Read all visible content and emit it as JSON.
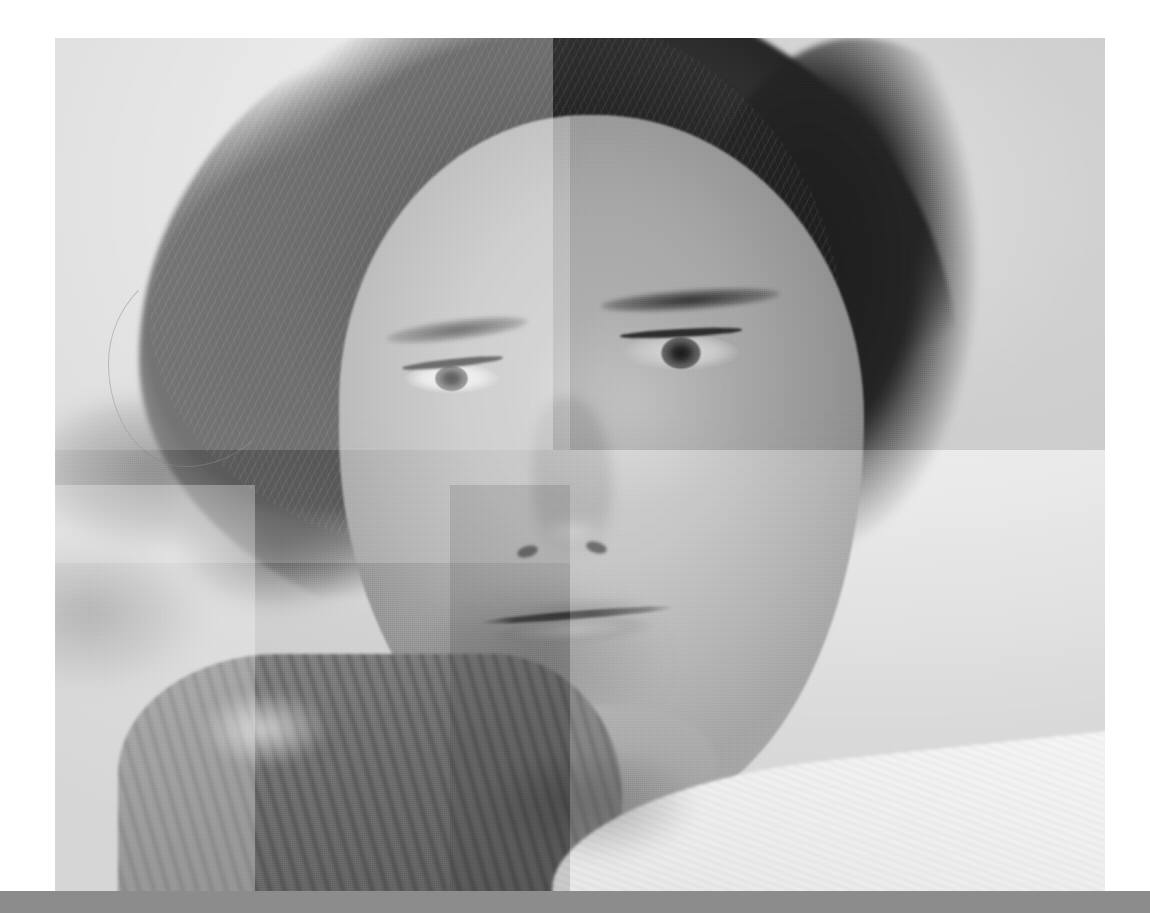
{
  "page": {
    "background_color": "#ffffff",
    "width": 1150,
    "height": 913
  },
  "photo": {
    "name": "grayscale-portrait",
    "subject": "woman looking at camera, curly dark hair, light knit sweater, dark jacket collar",
    "treatment": "black and white",
    "frame": {
      "left": 55,
      "top": 38,
      "width": 1050,
      "height": 855
    },
    "alt_text": "Black and white portrait of a woman with dark curly hair"
  },
  "overlay": {
    "description": "translucent rectangular panels forming an offset grid",
    "lighten_color": "#ffffff",
    "darken_color": "#282828",
    "panels": [
      {
        "name": "overlay-panel-top-left",
        "left": 0,
        "top": 0,
        "width": 498,
        "height": 412,
        "tone": "lighten"
      },
      {
        "name": "overlay-panel-top-right",
        "left": 515,
        "top": 0,
        "width": 535,
        "height": 412,
        "tone": "darken"
      },
      {
        "name": "overlay-panel-mid-band",
        "left": 0,
        "top": 412,
        "width": 1050,
        "height": 113,
        "tone": "lighten2"
      },
      {
        "name": "overlay-panel-lower-left",
        "left": 0,
        "top": 447,
        "width": 200,
        "height": 408,
        "tone": "lighten"
      },
      {
        "name": "overlay-panel-lower-center",
        "left": 395,
        "top": 447,
        "width": 120,
        "height": 408,
        "tone": "darken"
      },
      {
        "name": "overlay-panel-lower-right",
        "left": 515,
        "top": 525,
        "width": 535,
        "height": 330,
        "tone": "lighten2"
      }
    ]
  },
  "footer": {
    "name": "footer-band",
    "color": "#8c8c8c",
    "height": 22
  }
}
